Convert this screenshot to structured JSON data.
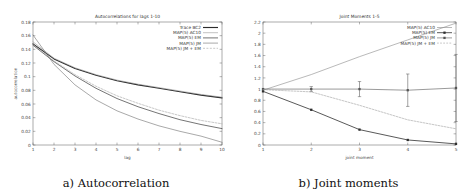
{
  "figure": {
    "captions": {
      "left": "a) Autocorrelation",
      "right": "b) Joint moments"
    }
  },
  "chart_data": [
    {
      "id": "autocorrelation",
      "type": "line",
      "title": "Autocorrelations for lags 1-10",
      "xlabel": "lag",
      "ylabel": "autocorrelation",
      "xlim": [
        1,
        10
      ],
      "ylim": [
        0,
        0.18
      ],
      "xticks": [
        1,
        2,
        3,
        4,
        5,
        6,
        7,
        8,
        9,
        10
      ],
      "xticklabels": [
        "1",
        "2",
        "3",
        "4",
        "5",
        "6",
        "7",
        "8",
        "9",
        "10"
      ],
      "yticks": [
        0,
        0.02,
        0.04,
        0.06,
        0.08,
        0.1,
        0.12,
        0.14,
        0.16,
        0.18
      ],
      "yticklabels": [
        "0",
        "0.02",
        "0.04",
        "0.06",
        "0.08",
        "0.1",
        "0.12",
        "0.14",
        "0.16",
        "0.18"
      ],
      "grid": false,
      "legend_position": "top-right",
      "x": [
        1,
        2,
        3,
        4,
        5,
        6,
        7,
        8,
        9,
        10
      ],
      "series": [
        {
          "name": "Trace BC2",
          "color": "#2b2b2b",
          "width": 1.15,
          "dash": "none",
          "values": [
            0.148,
            0.126,
            0.112,
            0.102,
            0.094,
            0.088,
            0.083,
            0.078,
            0.073,
            0.069
          ]
        },
        {
          "name": "MAP(5) AC10",
          "color": "#8f8f8f",
          "width": 0.55,
          "dash": "none",
          "values": [
            0.151,
            0.127,
            0.113,
            0.103,
            0.095,
            0.089,
            0.084,
            0.079,
            0.074,
            0.07
          ]
        },
        {
          "name": "MAP(5) EM",
          "color": "#3a3a3a",
          "width": 0.7,
          "dash": "none",
          "values": [
            0.146,
            0.122,
            0.101,
            0.083,
            0.068,
            0.056,
            0.046,
            0.037,
            0.03,
            0.024
          ]
        },
        {
          "name": "MAP(5) JM",
          "color": "#6e6e6e",
          "width": 0.6,
          "dash": "none",
          "values": [
            0.161,
            0.118,
            0.088,
            0.066,
            0.05,
            0.038,
            0.028,
            0.02,
            0.013,
            0.004
          ]
        },
        {
          "name": "MAP(5) JM + EM",
          "color": "#9a9a9a",
          "width": 0.55,
          "dash": "2,1.4",
          "values": [
            0.147,
            0.123,
            0.103,
            0.086,
            0.072,
            0.061,
            0.051,
            0.043,
            0.036,
            0.031
          ]
        }
      ]
    },
    {
      "id": "joint-moments",
      "type": "line",
      "title": "Joint Moments 1-5",
      "xlabel": "joint moment",
      "ylabel": "",
      "xlim": [
        1,
        5
      ],
      "ylim": [
        0,
        2.2
      ],
      "xticks": [
        1,
        2,
        3,
        4,
        5
      ],
      "xticklabels": [
        "1",
        "2",
        "3",
        "4",
        "5"
      ],
      "yticks": [
        0,
        0.2,
        0.4,
        0.6,
        0.8,
        1.0,
        1.2,
        1.4,
        1.6,
        1.8,
        2.0,
        2.2
      ],
      "yticklabels": [
        "0",
        "0.2",
        "0.4",
        "0.6",
        "0.8",
        "1",
        "1.2",
        "1.4",
        "1.6",
        "1.8",
        "2",
        "2.2"
      ],
      "grid": false,
      "legend_position": "top-right",
      "x": [
        1,
        2,
        3,
        4,
        5
      ],
      "series": [
        {
          "name": "MAP(5) AC10",
          "color": "#8a8a8a",
          "width": 0.6,
          "dash": "none",
          "marker": "none",
          "values": [
            0.98,
            1.26,
            1.58,
            1.88,
            2.18
          ]
        },
        {
          "name": "MAP(5) EM",
          "color": "#2e2e2e",
          "width": 0.8,
          "dash": "none",
          "marker": "square",
          "values": [
            0.96,
            0.63,
            0.275,
            0.09,
            0.02
          ]
        },
        {
          "name": "MAP(5) JM",
          "color": "#555555",
          "width": 0.6,
          "dash": "none",
          "marker": "square",
          "values": [
            1.0,
            1.0,
            1.0,
            0.98,
            1.02
          ],
          "errors": [
            0.0,
            0.045,
            0.135,
            0.29,
            0.6
          ]
        },
        {
          "name": "MAP(5) JM + EM",
          "color": "#a0a0a0",
          "width": 0.6,
          "dash": "1.8,1.3",
          "marker": "none",
          "values": [
            0.99,
            0.95,
            0.71,
            0.45,
            0.29
          ]
        }
      ]
    }
  ]
}
